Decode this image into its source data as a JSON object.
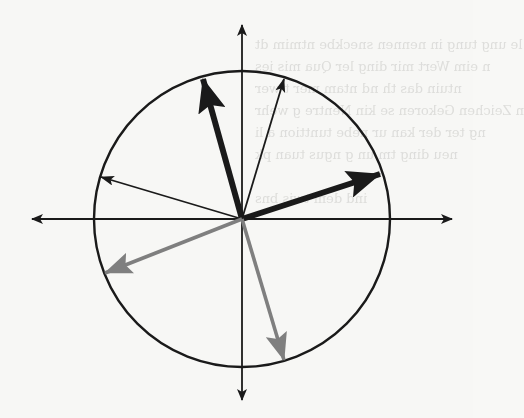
{
  "figure": {
    "colors": {
      "background": "#f7f7f5",
      "ink": "#1a1a1a",
      "gray_arrow": "#7f7f7f",
      "showthrough_text": "#c9c9c6"
    },
    "geometry": {
      "center": [
        242,
        219
      ],
      "radius": 148,
      "axes": {
        "x_left_tip": [
          32,
          219
        ],
        "x_right_tip": [
          452,
          219
        ],
        "y_top_tip": [
          242,
          25
        ],
        "y_bottom_tip": [
          242,
          400
        ]
      }
    },
    "vectors": [
      {
        "name": "thick-black-upper-left",
        "tip": [
          203,
          79
        ],
        "color": "#1a1a1a",
        "weight": "thick"
      },
      {
        "name": "thin-black-upper-right",
        "tip": [
          284,
          79
        ],
        "color": "#1a1a1a",
        "weight": "thin"
      },
      {
        "name": "thick-black-right",
        "tip": [
          380,
          174
        ],
        "color": "#1a1a1a",
        "weight": "thick"
      },
      {
        "name": "thin-black-left",
        "tip": [
          101,
          177
        ],
        "color": "#1a1a1a",
        "weight": "thin"
      },
      {
        "name": "gray-lower-left",
        "tip": [
          105,
          273
        ],
        "color": "#7f7f7f",
        "weight": "medium"
      },
      {
        "name": "gray-lower-right",
        "tip": [
          284,
          360
        ],
        "color": "#7f7f7f",
        "weight": "medium"
      }
    ]
  },
  "showthrough": {
    "note": "faint mirrored text bleeding through from reverse side of scanned page (illegible)",
    "lines": [
      "le ung tung in nennen sneckbe ntmim dt",
      "n eim Wert mir ding ler Qua mis ies",
      "ntuin das th nd ntam mer t wer",
      "n Zeichen Gekoren se kin Nentre g wehr",
      "ng ter der kan ur nebe tunttion a li",
      "neu ding tm un g ngus tuan pk",
      "ind dem twis bns"
    ]
  }
}
